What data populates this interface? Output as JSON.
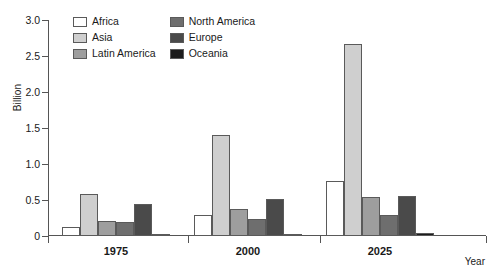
{
  "chart_data": {
    "type": "bar",
    "title": "",
    "xlabel": "Year",
    "ylabel": "Billion",
    "categories": [
      "1975",
      "2000",
      "2025"
    ],
    "ylim": [
      0,
      3.0
    ],
    "yticks": [
      "0",
      "0.5",
      "1.0",
      "1.5",
      "2.0",
      "2.5",
      "3.0"
    ],
    "ytick_values": [
      0,
      0.5,
      1.0,
      1.5,
      2.0,
      2.5,
      3.0
    ],
    "grid": false,
    "legend_position": "top-left-inside",
    "series": [
      {
        "name": "Africa",
        "color": "#ffffff",
        "values": [
          0.12,
          0.29,
          0.77
        ]
      },
      {
        "name": "Asia",
        "color": "#cfcfcf",
        "values": [
          0.59,
          1.4,
          2.66
        ]
      },
      {
        "name": "Latin America",
        "color": "#9e9e9e",
        "values": [
          0.21,
          0.37,
          0.54
        ]
      },
      {
        "name": "North America",
        "color": "#6e6e6e",
        "values": [
          0.19,
          0.23,
          0.29
        ]
      },
      {
        "name": "Europe",
        "color": "#4a4a4a",
        "values": [
          0.45,
          0.52,
          0.55
        ]
      },
      {
        "name": "Oceania",
        "color": "#1c1c1c",
        "values": [
          0.02,
          0.03,
          0.04
        ]
      }
    ]
  },
  "legend": {
    "items": [
      {
        "label": "Africa",
        "color": "#ffffff"
      },
      {
        "label": "North America",
        "color": "#6e6e6e"
      },
      {
        "label": "Asia",
        "color": "#cfcfcf"
      },
      {
        "label": "Europe",
        "color": "#4a4a4a"
      },
      {
        "label": "Latin America",
        "color": "#9e9e9e"
      },
      {
        "label": "Oceania",
        "color": "#1c1c1c"
      }
    ]
  }
}
